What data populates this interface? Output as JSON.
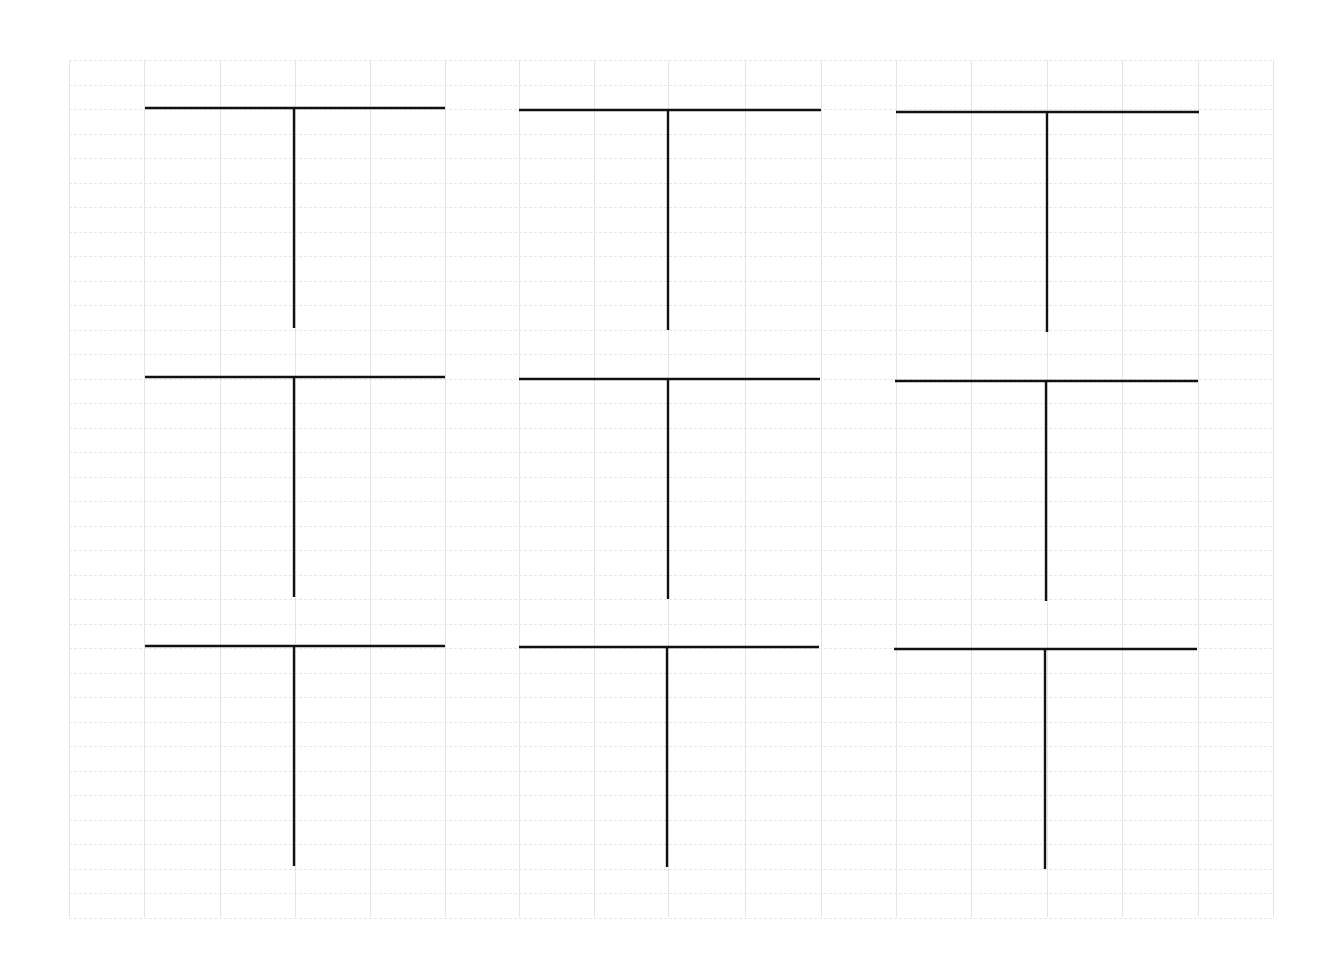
{
  "page": {
    "width": 1336,
    "height": 964,
    "background": "#ffffff"
  },
  "grid": {
    "left": 69,
    "top": 60,
    "right": 1273,
    "bottom": 917,
    "vertical_lines_x": [
      69,
      144,
      220,
      295,
      370,
      445,
      519,
      594,
      668,
      745,
      821,
      896,
      971,
      1047,
      1122,
      1198,
      1273
    ],
    "horizontal_spacing": 24.5,
    "line_color": "#e4e4e4"
  },
  "t_templates": {
    "line_color": "#111111",
    "count": 9,
    "rows": [
      {
        "name": "row-1",
        "items": [
          {
            "bar_x1": 145,
            "bar_x2": 445,
            "bar_y": 108,
            "stem_x": 294,
            "stem_y2": 328
          },
          {
            "bar_x1": 519,
            "bar_x2": 821,
            "bar_y": 110,
            "stem_x": 668,
            "stem_y2": 330
          },
          {
            "bar_x1": 896,
            "bar_x2": 1199,
            "bar_y": 112,
            "stem_x": 1047,
            "stem_y2": 332
          }
        ]
      },
      {
        "name": "row-2",
        "items": [
          {
            "bar_x1": 145,
            "bar_x2": 445,
            "bar_y": 377,
            "stem_x": 294,
            "stem_y2": 597
          },
          {
            "bar_x1": 519,
            "bar_x2": 820,
            "bar_y": 379,
            "stem_x": 668,
            "stem_y2": 599
          },
          {
            "bar_x1": 895,
            "bar_x2": 1198,
            "bar_y": 381,
            "stem_x": 1046,
            "stem_y2": 601
          }
        ]
      },
      {
        "name": "row-3",
        "items": [
          {
            "bar_x1": 145,
            "bar_x2": 445,
            "bar_y": 646,
            "stem_x": 294,
            "stem_y2": 866
          },
          {
            "bar_x1": 519,
            "bar_x2": 819,
            "bar_y": 647,
            "stem_x": 667,
            "stem_y2": 867
          },
          {
            "bar_x1": 894,
            "bar_x2": 1197,
            "bar_y": 649,
            "stem_x": 1045,
            "stem_y2": 869
          }
        ]
      }
    ]
  }
}
